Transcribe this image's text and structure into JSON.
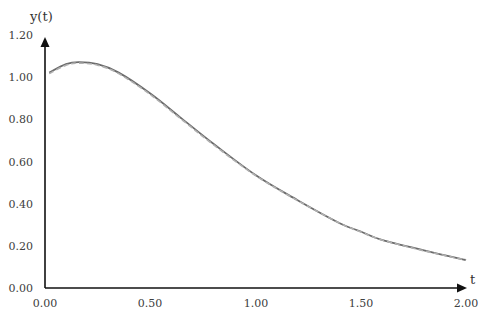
{
  "chart_data": {
    "type": "line",
    "title": "",
    "xlabel": "t",
    "ylabel": "y(t)",
    "xlim": [
      0,
      2
    ],
    "ylim": [
      0,
      1.2
    ],
    "grid": false,
    "legend": "none",
    "x_ticks": [
      "0.00",
      "0.50",
      "1.00",
      "1.50",
      "2.00"
    ],
    "y_ticks": [
      "0.00",
      "0.20",
      "0.40",
      "0.60",
      "0.80",
      "1.00",
      "1.20"
    ],
    "series": [
      {
        "name": "solid",
        "style": "solid",
        "color": "#6b6b6b",
        "x": [
          0.02,
          0.1,
          0.16,
          0.25,
          0.35,
          0.5,
          0.65,
          0.8,
          1.0,
          1.2,
          1.4,
          1.5,
          1.6,
          1.8,
          2.0
        ],
        "y": [
          1.03,
          1.07,
          1.08,
          1.07,
          1.03,
          0.93,
          0.81,
          0.69,
          0.54,
          0.42,
          0.31,
          0.27,
          0.23,
          0.18,
          0.134
        ]
      },
      {
        "name": "dashed",
        "style": "dashed",
        "color": "#b0b0b0",
        "x": [
          0.02,
          0.1,
          0.16,
          0.25,
          0.35,
          0.5,
          0.65,
          0.8,
          1.0,
          1.2,
          1.4,
          1.5,
          1.6,
          1.8,
          2.0
        ],
        "y": [
          1.025,
          1.065,
          1.075,
          1.065,
          1.025,
          0.925,
          0.805,
          0.685,
          0.538,
          0.418,
          0.31,
          0.268,
          0.23,
          0.178,
          0.133
        ]
      }
    ]
  },
  "axes": {
    "x_label": "t",
    "y_label": "y(t)",
    "x_ticks": [
      "0.00",
      "0.50",
      "1.00",
      "1.50",
      "2.00"
    ],
    "y_ticks": [
      "0.00",
      "0.20",
      "0.40",
      "0.60",
      "0.80",
      "1.00",
      "1.20"
    ]
  },
  "colors": {
    "axis": "#111111",
    "line_solid": "#6b6b6b",
    "line_dashed": "#b0b0b0"
  }
}
